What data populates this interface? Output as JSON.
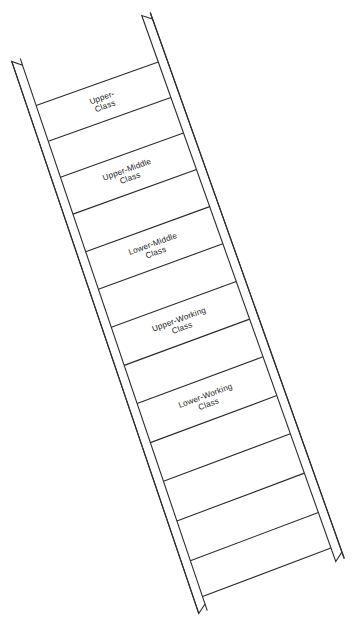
{
  "diagram": {
    "type": "ladder-diagram",
    "orientation": "diagonal-tilted",
    "background_color": "#ffffff",
    "line_color": "#2b2b2b",
    "text_color": "#1c1c1c",
    "rung_count": 10,
    "labeled_rung_count": 5
  },
  "rails": {
    "left": {
      "name": "left-rail",
      "top_tip": [
        16,
        60
      ],
      "bottom_tip": [
        203,
        612
      ],
      "outer_path": "M16,60 L24,54 L60,62 L211,602 L203,612 Z"
    },
    "right": {
      "name": "right-rail",
      "top_tip": [
        146,
        14
      ],
      "bottom_tip": [
        340,
        560
      ],
      "outer_path": "M146,14 L156,12 L166,34 L340,560 L329,552 Z"
    }
  },
  "rungs": [
    {
      "index": 1,
      "label_line1": "Upper-",
      "label_line2": "Class",
      "labeled": true
    },
    {
      "index": 2,
      "label_line1": "",
      "label_line2": "",
      "labeled": false
    },
    {
      "index": 3,
      "label_line1": "Upper-Middle",
      "label_line2": "Class",
      "labeled": true
    },
    {
      "index": 4,
      "label_line1": "",
      "label_line2": "",
      "labeled": false
    },
    {
      "index": 5,
      "label_line1": "Lower-Middle",
      "label_line2": "Class",
      "labeled": true
    },
    {
      "index": 6,
      "label_line1": "",
      "label_line2": "",
      "labeled": false
    },
    {
      "index": 7,
      "label_line1": "Upper-Working",
      "label_line2": "Class",
      "labeled": true
    },
    {
      "index": 8,
      "label_line1": "",
      "label_line2": "",
      "labeled": false
    },
    {
      "index": 9,
      "label_line1": "Lower-Working",
      "label_line2": "Class",
      "labeled": true
    },
    {
      "index": 10,
      "label_line1": "",
      "label_line2": "",
      "labeled": false
    }
  ],
  "labels": {
    "upper_class": "Upper-\nClass",
    "upper_middle_class": "Upper-Middle\nClass",
    "lower_middle_class": "Lower-Middle\nClass",
    "upper_working_class": "Upper-Working\nClass",
    "lower_working_class": "Lower-Working\nClass"
  },
  "geometry": {
    "rung_divider_t": [
      0.085,
      0.15,
      0.215,
      0.282,
      0.35,
      0.418,
      0.487,
      0.556,
      0.625,
      0.696,
      0.766,
      0.838,
      0.91,
      0.975
    ],
    "label_band_indices": [
      0,
      2,
      4,
      6,
      8
    ],
    "rail_direction_left": [
      0.322,
      0.947
    ],
    "rail_direction_right": [
      0.314,
      0.949
    ]
  }
}
